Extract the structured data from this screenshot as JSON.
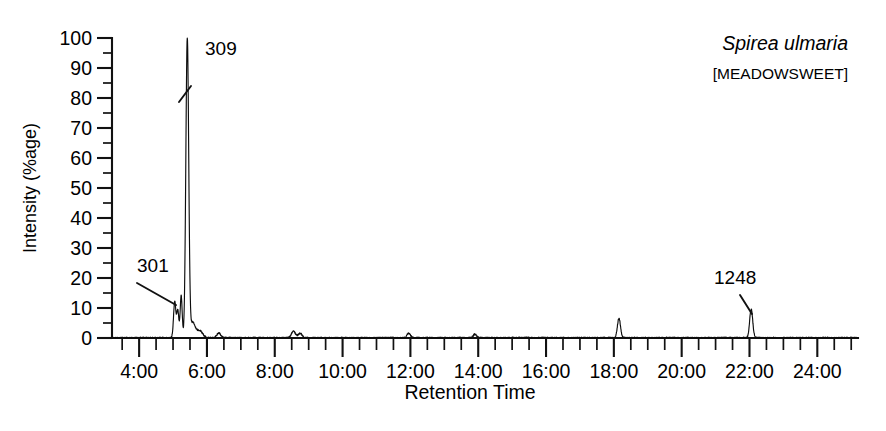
{
  "figure": {
    "background": "#ffffff",
    "ink_color": "#111111"
  },
  "annotations": {
    "species_scientific": "Spirea ulmaria",
    "species_common": "[MEADOWSWEET]"
  },
  "chart_data": {
    "type": "line",
    "title": "",
    "subtitle": "",
    "xlabel": "Retention Time",
    "ylabel": "Intensity (%age)",
    "grid": false,
    "legend": "none",
    "xlim": [
      3.2,
      25.2
    ],
    "ylim": [
      0,
      100
    ],
    "x_tick_labels": [
      "4:00",
      "6:00",
      "8:00",
      "10:00",
      "12:00",
      "14:00",
      "16:00",
      "18:00",
      "20:00",
      "22:00",
      "24:00"
    ],
    "x_major_ticks": [
      4,
      6,
      8,
      10,
      12,
      14,
      16,
      18,
      20,
      22,
      24
    ],
    "x_minor_ticks": [
      3.5,
      4.5,
      5,
      5.5,
      6.5,
      7,
      7.5,
      8.5,
      9,
      9.5,
      10.5,
      11,
      11.5,
      12.5,
      13,
      13.5,
      14.5,
      15,
      15.5,
      16.5,
      17,
      17.5,
      18.5,
      19,
      19.5,
      20.5,
      21,
      21.5,
      22.5,
      23,
      23.5,
      24.5,
      25
    ],
    "x_tick_unit": "minutes",
    "y_tick_labels": [
      "0",
      "10",
      "20",
      "30",
      "40",
      "50",
      "60",
      "70",
      "80",
      "90",
      "100"
    ],
    "y_major_ticks": [
      0,
      10,
      20,
      30,
      40,
      50,
      60,
      70,
      80,
      90,
      100
    ],
    "y_minor_ticks": [
      5,
      15,
      25,
      35,
      45,
      55,
      65,
      75,
      85,
      95
    ],
    "peaks": [
      {
        "label": "301",
        "retention_time": 5.05,
        "intensity": 12,
        "width": 0.035,
        "labeled": true
      },
      {
        "label": "",
        "retention_time": 5.14,
        "intensity": 9,
        "width": 0.03,
        "labeled": false
      },
      {
        "label": "",
        "retention_time": 5.24,
        "intensity": 14,
        "width": 0.03,
        "labeled": false
      },
      {
        "label": "309",
        "retention_time": 5.42,
        "intensity": 100,
        "width": 0.042,
        "labeled": true
      },
      {
        "label": "",
        "retention_time": 5.58,
        "intensity": 5,
        "width": 0.07,
        "labeled": false
      },
      {
        "label": "",
        "retention_time": 5.78,
        "intensity": 2.5,
        "width": 0.09,
        "labeled": false
      },
      {
        "label": "",
        "retention_time": 6.35,
        "intensity": 1.6,
        "width": 0.06,
        "labeled": false
      },
      {
        "label": "",
        "retention_time": 8.55,
        "intensity": 2.2,
        "width": 0.06,
        "labeled": false
      },
      {
        "label": "",
        "retention_time": 8.75,
        "intensity": 1.5,
        "width": 0.06,
        "labeled": false
      },
      {
        "label": "",
        "retention_time": 11.95,
        "intensity": 1.6,
        "width": 0.05,
        "labeled": false
      },
      {
        "label": "",
        "retention_time": 13.9,
        "intensity": 1.2,
        "width": 0.05,
        "labeled": false
      },
      {
        "label": "",
        "retention_time": 18.15,
        "intensity": 6.5,
        "width": 0.045,
        "labeled": false
      },
      {
        "label": "1248",
        "retention_time": 22.05,
        "intensity": 9.5,
        "width": 0.045,
        "labeled": true
      }
    ],
    "peak_annotations": [
      {
        "label": "301",
        "retention_time": 5.05,
        "intensity": 12
      },
      {
        "label": "309",
        "retention_time": 5.42,
        "intensity": 100
      },
      {
        "label": "1248",
        "retention_time": 22.05,
        "intensity": 9.5
      }
    ],
    "baseline_noise_amplitude": 0.55
  }
}
